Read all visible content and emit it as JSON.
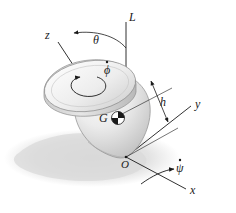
{
  "figure": {
    "background_color": "#ffffff",
    "ink_color": "#1a1a1a",
    "shadow_color": "#d8d8d8",
    "body_color": "#e9e9e9"
  },
  "labels": {
    "vertical_axis": "L",
    "spin_axis": "z",
    "nutation_angle": "θ",
    "spin_rate": "ϕ",
    "center_of_gravity": "G",
    "height": "h",
    "y_axis": "y",
    "x_axis": "x",
    "origin": "O",
    "precession_rate": "ψ"
  },
  "markers": {
    "spin_dot": "˙",
    "precession_dot": "˙"
  },
  "icons": {
    "cg_symbol": "center-of-gravity-icon",
    "spin_arrow": "spin-arrow-icon",
    "precession_arrow": "precession-arrow-icon",
    "dimension_arrow": "dimension-arrow-icon"
  },
  "geometry": {
    "origin_point": [
      126,
      157
    ],
    "vertical_line_top": [
      126,
      22
    ],
    "z_axis_label_point": [
      49,
      36
    ],
    "y_axis_label_point": [
      196,
      107
    ],
    "x_axis_label_point": [
      190,
      192
    ],
    "theta_arc_label_point": [
      97,
      42
    ],
    "h_label_point": [
      163,
      103
    ],
    "cg_point": [
      110,
      118
    ]
  }
}
